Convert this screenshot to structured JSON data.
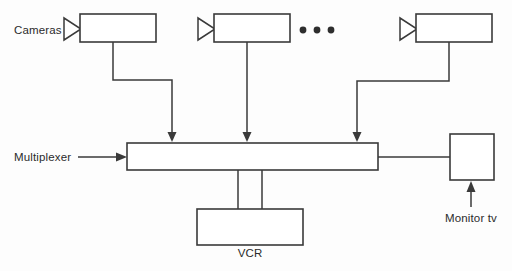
{
  "diagram": {
    "background_color": "#fdfdfd",
    "line_color": "#3a3a3a",
    "text_color": "#2b2b2b",
    "labels": {
      "cameras": "Cameras",
      "multiplexer": "Multiplexer",
      "vcr": "VCR",
      "monitor": "Monitor tv",
      "ellipsis": "• • •"
    },
    "nodes": [
      {
        "id": "camera-1",
        "type": "camera",
        "x": 80,
        "y": 14,
        "w": 76,
        "h": 28
      },
      {
        "id": "camera-2",
        "type": "camera",
        "x": 214,
        "y": 14,
        "w": 76,
        "h": 28
      },
      {
        "id": "camera-3",
        "type": "camera",
        "x": 416,
        "y": 14,
        "w": 76,
        "h": 28
      },
      {
        "id": "multiplexer-bar",
        "type": "bar",
        "x": 127,
        "y": 143,
        "w": 251,
        "h": 27
      },
      {
        "id": "vcr-box",
        "type": "box",
        "x": 197,
        "y": 209,
        "w": 106,
        "h": 36
      },
      {
        "id": "monitor-box",
        "type": "box",
        "x": 450,
        "y": 134,
        "w": 44,
        "h": 46
      }
    ],
    "connections": [
      {
        "from": "camera-1",
        "to": "multiplexer-bar",
        "arrow": true
      },
      {
        "from": "camera-2",
        "to": "multiplexer-bar",
        "arrow": true
      },
      {
        "from": "camera-3",
        "to": "multiplexer-bar",
        "arrow": true
      },
      {
        "from": "multiplexer-label",
        "to": "multiplexer-bar",
        "arrow": true
      },
      {
        "from": "multiplexer-bar",
        "to": "vcr-box",
        "arrow": false
      },
      {
        "from": "multiplexer-bar",
        "to": "monitor-box",
        "arrow": false
      },
      {
        "from": "monitor-label",
        "to": "monitor-box",
        "arrow": true
      }
    ],
    "camera_count_shown": 3,
    "ellipsis_indicates_more": true
  }
}
